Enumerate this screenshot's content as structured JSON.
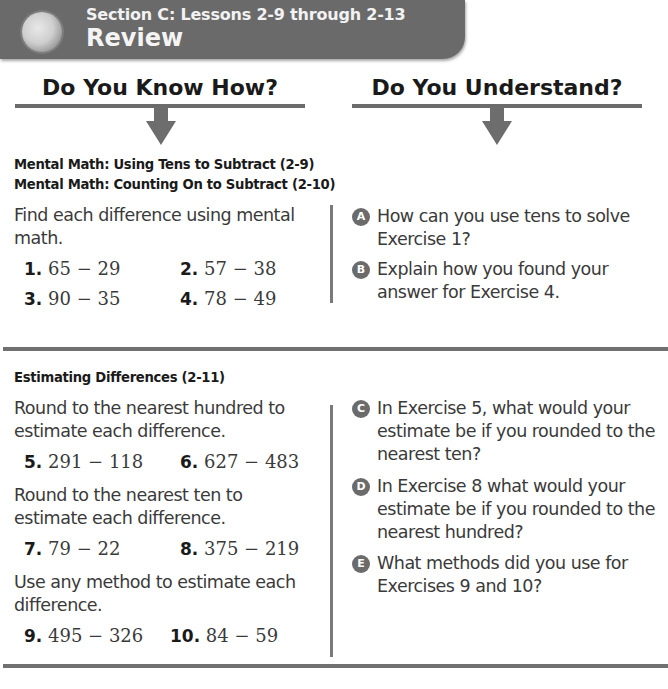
{
  "banner": {
    "subtitle": "Section C: Lessons 2-9 through 2-13",
    "title": "Review",
    "icon": "review-globe-icon"
  },
  "columns": {
    "left_heading": "Do You Know How?",
    "right_heading": "Do You Understand?"
  },
  "section1": {
    "topics": [
      "Mental Math: Using Tens to Subtract (2-9)",
      "Mental Math: Counting On to Subtract (2-10)"
    ],
    "instruction": "Find each difference using mental math.",
    "exercises": [
      {
        "num": "1.",
        "expr": "65 − 29"
      },
      {
        "num": "2.",
        "expr": "57 − 38"
      },
      {
        "num": "3.",
        "expr": "90 − 35"
      },
      {
        "num": "4.",
        "expr": "78 − 49"
      }
    ],
    "questions": [
      {
        "letter": "A",
        "text": "How can you use tens to solve Exercise 1?"
      },
      {
        "letter": "B",
        "text": "Explain how you found your answer for Exercise 4."
      }
    ]
  },
  "section2": {
    "topic": "Estimating Differences (2-11)",
    "instruction1": "Round to the nearest hundred to estimate each difference.",
    "instruction2": "Round to the nearest ten to estimate each difference.",
    "instruction3": "Use any method to estimate each difference.",
    "exercises": [
      {
        "num": "5.",
        "expr": "291 − 118"
      },
      {
        "num": "6.",
        "expr": "627 − 483"
      },
      {
        "num": "7.",
        "expr": "79 − 22"
      },
      {
        "num": "8.",
        "expr": "375 − 219"
      },
      {
        "num": "9.",
        "expr": "495 − 326"
      },
      {
        "num": "10.",
        "expr": "84 − 59"
      }
    ],
    "questions": [
      {
        "letter": "C",
        "text": "In Exercise 5, what would your estimate be if you rounded to the nearest ten?"
      },
      {
        "letter": "D",
        "text": "In Exercise 8 what would your estimate be if you rounded to the nearest hundred?"
      },
      {
        "letter": "E",
        "text": "What methods did you use for Exercises 9 and 10?"
      }
    ]
  }
}
